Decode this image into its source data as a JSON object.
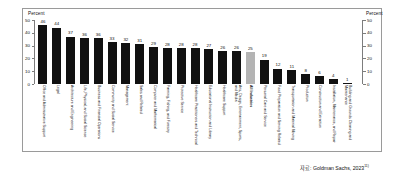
{
  "axis": {
    "left_title": "Percent",
    "right_title": "Percent",
    "ticks": [
      "50",
      "40",
      "30",
      "20",
      "10",
      "0"
    ]
  },
  "source": {
    "text": "자료: Goldman Sachs, 2023",
    "marker": "11)"
  },
  "chart_data": {
    "type": "bar",
    "title": "",
    "xlabel": "",
    "ylabel": "Percent",
    "ylim": [
      0,
      50
    ],
    "grid": false,
    "legend": "none",
    "highlight_category": "All Industries",
    "highlight_color": "#b4b4b4",
    "bar_color": "#111111",
    "categories": [
      "Office and Administrative Support",
      "Legal",
      "Architecture and Engineering",
      "Life, Physical, and Social Science",
      "Business and Financial Operations",
      "Community and Social Service",
      "Management",
      "Sales and Related",
      "Computer and Mathematical",
      "Farming, Fishing, and Forestry",
      "Protective Service",
      "Healthcare Practitioners and Technical",
      "Educational Instruction and Library",
      "Healthcare Support",
      "Arts, Design, Entertainment, Sports, and Media",
      "All Industries",
      "Personal Care and Service",
      "Food Preparation and Serving Related",
      "Transportation and Material Moving",
      "Production",
      "Construction and Extraction",
      "Installation, Maintenance, and Repair",
      "Building and Grounds Cleaning and Maintenance"
    ],
    "values": [
      46,
      44,
      37,
      36,
      36,
      33,
      32,
      31,
      29,
      28,
      28,
      28,
      27,
      26,
      26,
      25,
      19,
      12,
      11,
      8,
      6,
      4,
      1
    ]
  }
}
